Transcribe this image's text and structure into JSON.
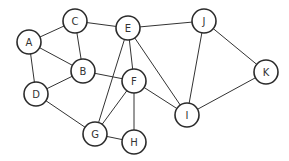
{
  "graph": {
    "title": "",
    "node_radius": 12,
    "colors": {
      "stroke": "#2b2b2b",
      "fill": "#ffffff",
      "edge": "#333333",
      "label": "#333333"
    },
    "nodes": [
      {
        "id": "A",
        "label": "A",
        "x": 29,
        "y": 42
      },
      {
        "id": "C",
        "label": "C",
        "x": 75,
        "y": 21
      },
      {
        "id": "E",
        "label": "E",
        "x": 128,
        "y": 28
      },
      {
        "id": "J",
        "label": "J",
        "x": 204,
        "y": 21
      },
      {
        "id": "K",
        "label": "K",
        "x": 266,
        "y": 72
      },
      {
        "id": "B",
        "label": "B",
        "x": 83,
        "y": 71
      },
      {
        "id": "F",
        "label": "F",
        "x": 134,
        "y": 81
      },
      {
        "id": "D",
        "label": "D",
        "x": 36,
        "y": 94
      },
      {
        "id": "I",
        "label": "I",
        "x": 187,
        "y": 115
      },
      {
        "id": "G",
        "label": "G",
        "x": 95,
        "y": 134
      },
      {
        "id": "H",
        "label": "H",
        "x": 134,
        "y": 142
      }
    ],
    "edges": [
      [
        "A",
        "C"
      ],
      [
        "A",
        "B"
      ],
      [
        "A",
        "D"
      ],
      [
        "C",
        "B"
      ],
      [
        "C",
        "E"
      ],
      [
        "E",
        "J"
      ],
      [
        "E",
        "F"
      ],
      [
        "E",
        "G"
      ],
      [
        "E",
        "I"
      ],
      [
        "B",
        "F"
      ],
      [
        "B",
        "D"
      ],
      [
        "D",
        "G"
      ],
      [
        "F",
        "G"
      ],
      [
        "F",
        "H"
      ],
      [
        "F",
        "I"
      ],
      [
        "G",
        "H"
      ],
      [
        "J",
        "I"
      ],
      [
        "J",
        "K"
      ],
      [
        "K",
        "I"
      ]
    ]
  }
}
